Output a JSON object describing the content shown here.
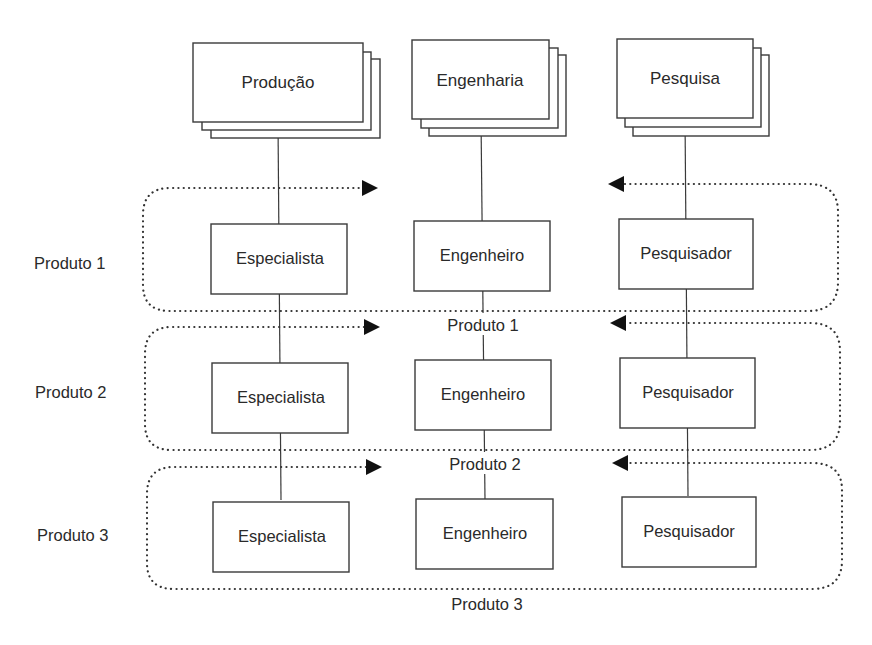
{
  "departments": [
    {
      "label": "Produção"
    },
    {
      "label": "Engenharia"
    },
    {
      "label": "Pesquisa"
    }
  ],
  "products": [
    {
      "side_label": "Produto 1",
      "loop_label": "Produto 1",
      "roles": [
        "Especialista",
        "Engenheiro",
        "Pesquisador"
      ]
    },
    {
      "side_label": "Produto 2",
      "loop_label": "Produto 2",
      "roles": [
        "Especialista",
        "Engenheiro",
        "Pesquisador"
      ]
    },
    {
      "side_label": "Produto 3",
      "loop_label": "Produto 3",
      "roles": [
        "Especialista",
        "Engenheiro",
        "Pesquisador"
      ]
    }
  ],
  "colors": {
    "line": "#3a3a3a",
    "text": "#2a2a2a",
    "arrowhead": "#111111",
    "background": "#ffffff"
  }
}
